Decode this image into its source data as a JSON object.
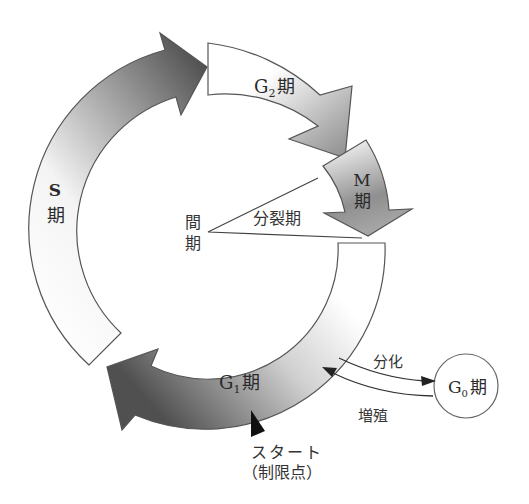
{
  "diagram": {
    "phases": {
      "s": {
        "label_latin": "S",
        "label_kanji": "期"
      },
      "g2": {
        "label_latin": "G",
        "label_sub": "2",
        "label_kanji": "期"
      },
      "m": {
        "label_latin": "M",
        "label_kanji": "期"
      },
      "g1": {
        "label_latin": "G",
        "label_sub": "1",
        "label_kanji": "期"
      },
      "g0": {
        "label_latin": "G",
        "label_sub": "0",
        "label_kanji": "期"
      }
    },
    "interphase": {
      "line1": "間",
      "line2": "期"
    },
    "mitotic_phase": {
      "label": "分裂期"
    },
    "transitions": {
      "differentiation": "分化",
      "proliferation": "増殖"
    },
    "checkpoint": {
      "line1": "スタート",
      "line2": "（制限点）"
    }
  },
  "colors": {
    "arrow_dark": "#4a4a4a",
    "arrow_mid": "#9a9a9a",
    "arrow_light": "#ffffff",
    "outline": "#555555",
    "text": "#2a2a2a",
    "checkpoint_marker": "#111111"
  }
}
